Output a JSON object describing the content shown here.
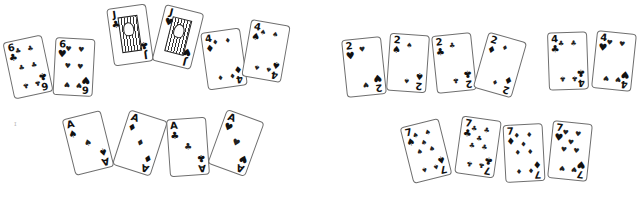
{
  "scene": "Playing cards laid out on a white table",
  "groups": [
    {
      "name": "left-top",
      "cards": [
        {
          "rank": "6",
          "suit": "♣",
          "suit_name": "clubs"
        },
        {
          "rank": "6",
          "suit": "♥",
          "suit_name": "hearts"
        },
        {
          "rank": "J",
          "suit": "♣",
          "suit_name": "clubs"
        },
        {
          "rank": "J",
          "suit": "♥",
          "suit_name": "hearts"
        },
        {
          "rank": "4",
          "suit": "♦",
          "suit_name": "diamonds"
        },
        {
          "rank": "4",
          "suit": "♠",
          "suit_name": "spades"
        }
      ]
    },
    {
      "name": "left-bottom",
      "cards": [
        {
          "rank": "A",
          "suit": "♠",
          "suit_name": "spades"
        },
        {
          "rank": "A",
          "suit": "♦",
          "suit_name": "diamonds"
        },
        {
          "rank": "A",
          "suit": "♣",
          "suit_name": "clubs"
        },
        {
          "rank": "A",
          "suit": "♥",
          "suit_name": "hearts"
        }
      ]
    },
    {
      "name": "right-top",
      "cards": [
        {
          "rank": "2",
          "suit": "♥",
          "suit_name": "hearts"
        },
        {
          "rank": "2",
          "suit": "♠",
          "suit_name": "spades"
        },
        {
          "rank": "2",
          "suit": "♣",
          "suit_name": "clubs"
        },
        {
          "rank": "2",
          "suit": "♦",
          "suit_name": "diamonds"
        },
        {
          "rank": "4",
          "suit": "♣",
          "suit_name": "clubs"
        },
        {
          "rank": "4",
          "suit": "♥",
          "suit_name": "hearts"
        }
      ]
    },
    {
      "name": "right-bottom",
      "cards": [
        {
          "rank": "7",
          "suit": "♠",
          "suit_name": "spades"
        },
        {
          "rank": "7",
          "suit": "♣",
          "suit_name": "clubs"
        },
        {
          "rank": "7",
          "suit": "♦",
          "suit_name": "diamonds"
        },
        {
          "rank": "7",
          "suit": "♥",
          "suit_name": "hearts"
        }
      ]
    }
  ],
  "colors": {
    "card_border": "#6f6f6f",
    "ink": "#111111",
    "background": "#ffffff"
  }
}
